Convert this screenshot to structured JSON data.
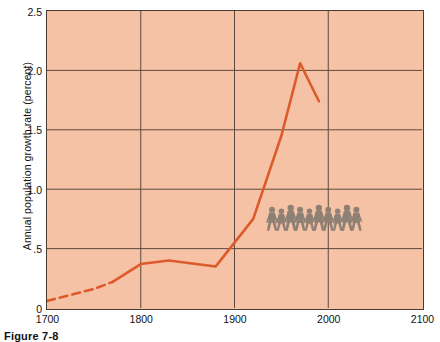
{
  "chart_data": {
    "type": "line",
    "title": "",
    "xlabel": "",
    "ylabel": "Annual population growth rate (percent)",
    "xlim": [
      1700,
      2100
    ],
    "ylim": [
      0,
      2.5
    ],
    "grid": true,
    "legend": null,
    "xticks": [
      "1700",
      "1800",
      "1900",
      "2000",
      "2100"
    ],
    "xtick_values": [
      1700,
      1800,
      1900,
      2000,
      2100
    ],
    "yticks": [
      "0",
      ".5",
      "1.0",
      "1.5",
      "2.0",
      "2.5"
    ],
    "ytick_values": [
      0,
      0.5,
      1.0,
      1.5,
      2.0,
      2.5
    ],
    "series": [
      {
        "name": "Annual population growth rate",
        "color": "#DD5B2B",
        "style": "dashed",
        "segment": "estimated",
        "x": [
          1700,
          1725,
          1750,
          1770
        ],
        "values": [
          0.06,
          0.11,
          0.16,
          0.22
        ]
      },
      {
        "name": "Annual population growth rate",
        "color": "#DD5B2B",
        "style": "solid",
        "segment": "observed",
        "x": [
          1770,
          1800,
          1830,
          1880,
          1900,
          1920,
          1950,
          1970,
          1990
        ],
        "values": [
          0.22,
          0.37,
          0.4,
          0.35,
          0.55,
          0.75,
          1.45,
          2.06,
          1.74
        ]
      }
    ],
    "annotations": [
      {
        "name": "walking-people-figures",
        "kind": "pictogram",
        "count": 10,
        "color": "#8E8074",
        "x_range": [
          1935,
          2035
        ],
        "y": 0.65
      }
    ],
    "colors": {
      "plot_background": "#F6C2A6",
      "grid": "#5c4a3e",
      "frame": "#4a3a30",
      "line": "#DD5B2B",
      "pictogram": "#8E8074",
      "text": "#111111"
    }
  },
  "caption": {
    "label": "Figure 7-8"
  }
}
